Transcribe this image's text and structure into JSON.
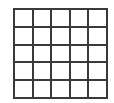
{
  "grid": {
    "rows": 5,
    "columns": 5,
    "line_color": "#3a3a3a",
    "cells": [
      [
        "",
        "",
        "",
        "",
        ""
      ],
      [
        "",
        "",
        "",
        "",
        ""
      ],
      [
        "",
        "",
        "",
        "",
        ""
      ],
      [
        "",
        "",
        "",
        "",
        ""
      ],
      [
        "",
        "",
        "",
        "",
        ""
      ]
    ]
  }
}
